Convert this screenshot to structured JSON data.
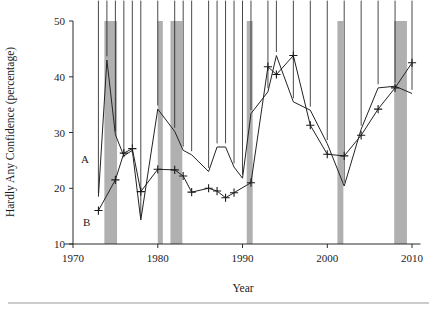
{
  "figure": {
    "background_color": "#ffffff",
    "band_color": "#b0b0b0",
    "line_color": "#232323",
    "axis_color": "#2b2b2b"
  },
  "axes": {
    "y_title": "Hardly Any Confidence (percentage)",
    "x_title": "Year",
    "y_ticks": [
      "10",
      "20",
      "30",
      "40",
      "50"
    ],
    "x_ticks": [
      "1970",
      "1980",
      "1990",
      "2000",
      "2010"
    ]
  },
  "annotations": [
    {
      "label": "A",
      "year": 1971.4,
      "value": 24.6
    },
    {
      "label": "B",
      "year": 1971.6,
      "value": 13.2
    }
  ],
  "chart_data": {
    "type": "line",
    "title": "",
    "xlabel": "Year",
    "ylabel": "Hardly Any Confidence (percentage)",
    "xlim": [
      1969,
      2011
    ],
    "ylim": [
      10,
      50
    ],
    "xticks": [
      1970,
      1980,
      1990,
      2000,
      2010
    ],
    "yticks": [
      10,
      20,
      30,
      40,
      50
    ],
    "grid": false,
    "legend_position": "none",
    "marker_series_labels": {
      "A": "diamond series",
      "B": "plus series"
    },
    "shaded_bands": [
      {
        "start": 1973.7,
        "end": 1975.2
      },
      {
        "start": 1980.0,
        "end": 1980.6
      },
      {
        "start": 1981.5,
        "end": 1982.9
      },
      {
        "start": 1990.5,
        "end": 1991.2
      },
      {
        "start": 2001.2,
        "end": 2001.9
      },
      {
        "start": 2007.9,
        "end": 2009.4
      }
    ],
    "series": [
      {
        "name": "A",
        "marker": "diamond",
        "x": [
          1973,
          1974,
          1975,
          1976,
          1977,
          1978,
          1980,
          1982,
          1983,
          1984,
          1986,
          1987,
          1988,
          1989,
          1990,
          1991,
          1993,
          1994,
          1996,
          1998,
          2000,
          2002,
          2004,
          2006,
          2008,
          2010
        ],
        "values": [
          18.5,
          43.0,
          29.6,
          25.8,
          26.8,
          14.3,
          34.2,
          30.2,
          26.8,
          26.0,
          23.0,
          27.4,
          27.4,
          23.8,
          21.8,
          33.4,
          37.3,
          43.8,
          35.5,
          34.0,
          28.0,
          20.4,
          30.6,
          38.0,
          38.3,
          37.0
        ]
      },
      {
        "name": "B",
        "marker": "plus",
        "x": [
          1973,
          1975,
          1976,
          1977,
          1978,
          1980,
          1982,
          1983,
          1984,
          1986,
          1987,
          1988,
          1989,
          1991,
          1993,
          1994,
          1996,
          1998,
          2000,
          2002,
          2004,
          2006,
          2008,
          2010
        ],
        "values": [
          16.0,
          21.5,
          26.3,
          27.1,
          19.4,
          23.4,
          23.3,
          22.2,
          19.3,
          20.0,
          19.5,
          18.3,
          19.2,
          21.0,
          41.8,
          40.4,
          43.8,
          31.3,
          26.1,
          25.8,
          29.5,
          34.2,
          38.0,
          42.5
        ]
      }
    ]
  }
}
